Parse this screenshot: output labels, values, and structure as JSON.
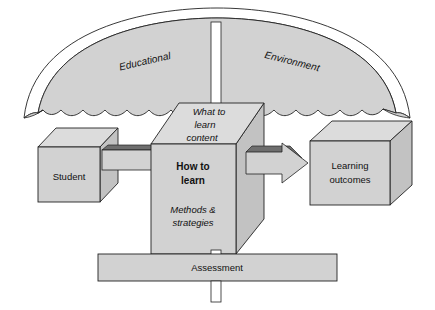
{
  "diagram": {
    "title_parts": {
      "left": "Educational",
      "right": "Environment"
    },
    "nodes": {
      "student": {
        "label": "Student"
      },
      "center": {
        "top_face": "What to\nlearn\ncontent",
        "top_face_lines": [
          "What to",
          "learn",
          "content"
        ],
        "front_heading_lines": [
          "How to",
          "learn"
        ],
        "front_sub_lines": [
          "Methods &",
          "strategies"
        ]
      },
      "outcomes": {
        "label_lines": [
          "Learning",
          "outcomes"
        ]
      },
      "assessment": {
        "label": "Assessment"
      }
    },
    "colors": {
      "fill_face": "#d2d2d2",
      "fill_top": "#dcdcdc",
      "fill_side": "#c2c2c2",
      "fill_canopy": "#d2d2d2",
      "arrow_bevel": "#6e6e6e",
      "stroke": "#222222",
      "pole": "#ffffff",
      "background": "#ffffff",
      "text": "#111111"
    }
  }
}
